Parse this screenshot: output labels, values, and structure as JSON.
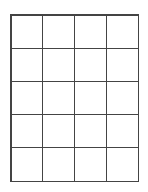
{
  "grid": {
    "rows": 5,
    "columns": 4,
    "line_color": "#444444",
    "background": "#ffffff",
    "cells": [
      [
        "",
        "",
        "",
        ""
      ],
      [
        "",
        "",
        "",
        ""
      ],
      [
        "",
        "",
        "",
        ""
      ],
      [
        "",
        "",
        "",
        ""
      ],
      [
        "",
        "",
        "",
        ""
      ]
    ]
  }
}
